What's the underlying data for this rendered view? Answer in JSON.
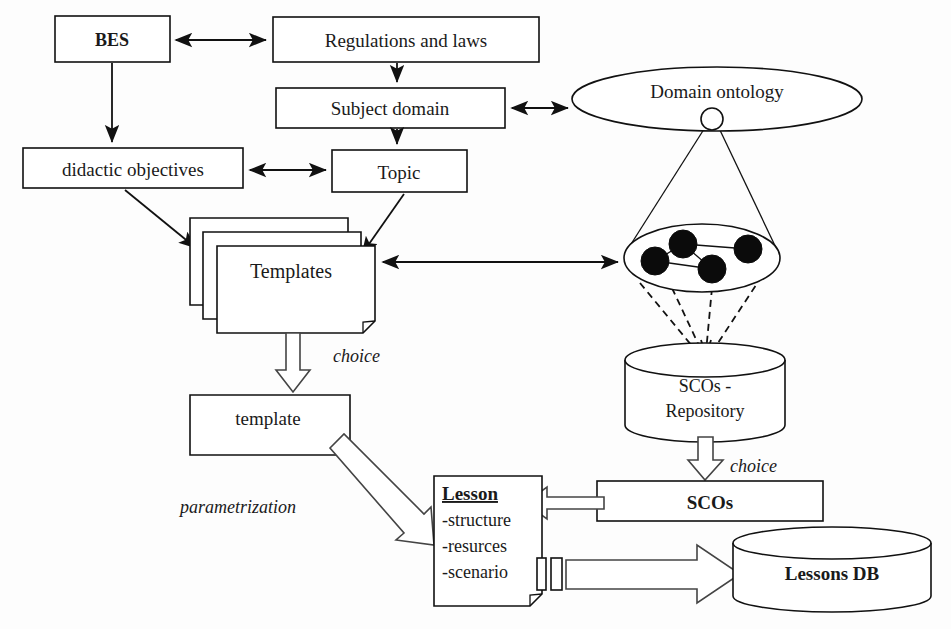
{
  "diagram": {
    "background_color": "#fdfdfd",
    "stroke_color": "#111111",
    "node_fill_color": "#0b0b0b",
    "nodes": {
      "bes": {
        "label": "BES",
        "shape": "rect",
        "x": 55,
        "y": 16,
        "w": 115,
        "h": 46
      },
      "regulations": {
        "label": "Regulations and laws",
        "shape": "rect",
        "x": 273,
        "y": 17,
        "w": 266,
        "h": 45
      },
      "subject_domain": {
        "label": "Subject domain",
        "shape": "rect",
        "x": 276,
        "y": 88,
        "w": 229,
        "h": 40
      },
      "domain_ontology": {
        "label": "Domain ontology",
        "shape": "ellipse",
        "cx": 717,
        "cy": 99,
        "rx": 145,
        "ry": 32
      },
      "didactic_objectives": {
        "label": "didactic objectives",
        "shape": "rect",
        "x": 23,
        "y": 148,
        "w": 220,
        "h": 40
      },
      "topic": {
        "label": "Topic",
        "shape": "rect",
        "x": 332,
        "y": 150,
        "w": 135,
        "h": 42
      },
      "templates": {
        "label": "Templates",
        "shape": "document-stack",
        "x": 190,
        "y": 218,
        "w": 165,
        "h": 95
      },
      "template": {
        "label": "template",
        "shape": "document",
        "x": 190,
        "y": 395,
        "w": 160,
        "h": 58
      },
      "sco_cluster": {
        "label": "",
        "shape": "ellipse-nodes",
        "cx": 702,
        "cy": 258,
        "rx": 78,
        "ry": 34
      },
      "scos_repository": {
        "label_line1": "SCOs -",
        "label_line2": "Repository",
        "shape": "cylinder",
        "x": 625,
        "y": 345,
        "w": 160,
        "h": 92
      },
      "scos": {
        "label": "SCOs",
        "shape": "rect",
        "x": 597,
        "y": 481,
        "w": 226,
        "h": 40
      },
      "lesson": {
        "title": "Lesson",
        "items": [
          "-structure",
          "-resurces",
          "-scenario"
        ],
        "shape": "document",
        "x": 434,
        "y": 476,
        "w": 108,
        "h": 130
      },
      "lessons_db": {
        "label": "Lessons DB",
        "shape": "cylinder",
        "x": 733,
        "y": 528,
        "w": 198,
        "h": 82
      }
    },
    "edge_labels": [
      {
        "id": "choice-templates",
        "text": "choice",
        "x": 333,
        "y": 360,
        "style": "italic"
      },
      {
        "id": "choice-scos",
        "text": "choice",
        "x": 714,
        "y": 474,
        "style": "italic"
      },
      {
        "id": "parametrization",
        "text": "parametrization",
        "x": 184,
        "y": 507,
        "style": "italic"
      }
    ],
    "sco_cluster_nodes": [
      {
        "cx": 655,
        "cy": 261,
        "r": 14
      },
      {
        "cx": 683,
        "cy": 244,
        "r": 14
      },
      {
        "cx": 712,
        "cy": 269,
        "r": 14
      },
      {
        "cx": 748,
        "cy": 249,
        "r": 14
      }
    ],
    "edges": [
      {
        "from": "bes",
        "to": "regulations",
        "type": "double-arrow"
      },
      {
        "from": "bes",
        "to": "didactic_objectives",
        "type": "arrow"
      },
      {
        "from": "regulations",
        "to": "subject_domain",
        "type": "arrow"
      },
      {
        "from": "subject_domain",
        "to": "domain_ontology",
        "type": "double-arrow"
      },
      {
        "from": "subject_domain",
        "to": "topic",
        "type": "arrow"
      },
      {
        "from": "didactic_objectives",
        "to": "topic",
        "type": "double-arrow"
      },
      {
        "from": "didactic_objectives",
        "to": "templates",
        "type": "arrow"
      },
      {
        "from": "topic",
        "to": "templates",
        "type": "arrow"
      },
      {
        "from": "sco_cluster",
        "to": "templates",
        "type": "double-arrow"
      },
      {
        "from": "domain_ontology",
        "to": "sco_cluster",
        "type": "cone"
      },
      {
        "from": "sco_cluster",
        "to": "scos_repository",
        "type": "dashed-cone"
      },
      {
        "from": "templates",
        "to": "template",
        "type": "hollow-arrow",
        "label": "choice"
      },
      {
        "from": "scos_repository",
        "to": "scos",
        "type": "hollow-arrow",
        "label": "choice"
      },
      {
        "from": "template",
        "to": "lesson",
        "type": "hollow-arrow-diagonal",
        "label": "parametrization"
      },
      {
        "from": "scos",
        "to": "lesson",
        "type": "hollow-arrow-left"
      },
      {
        "from": "lesson",
        "to": "lessons_db",
        "type": "hollow-arrow-right"
      }
    ]
  }
}
